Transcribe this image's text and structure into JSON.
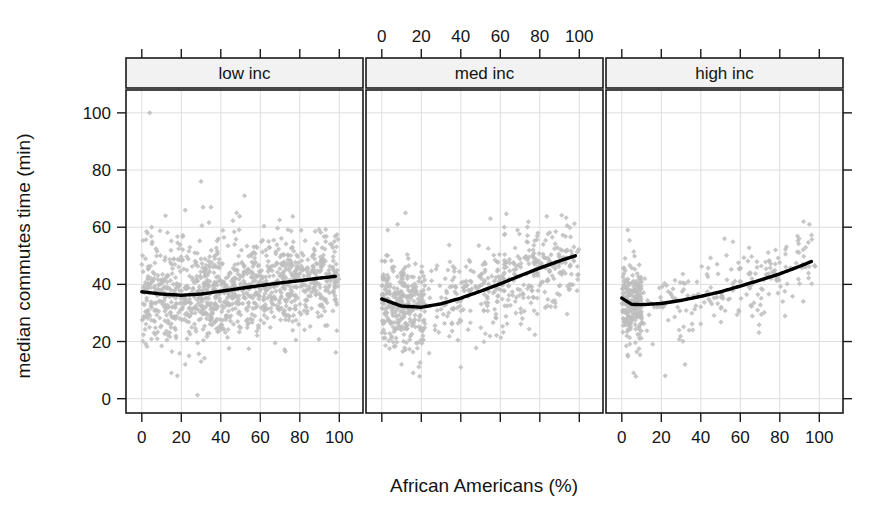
{
  "figure": {
    "kind": "lattice-trellis-scatter",
    "width": 888,
    "height": 513
  },
  "axes": {
    "x_title": "African Americans (%)",
    "y_title": "median commutes time (min)",
    "x_ticks": [
      0,
      20,
      40,
      60,
      80,
      100
    ],
    "y_ticks": [
      0,
      20,
      40,
      60,
      80,
      100
    ],
    "x_tick_labels": [
      "0",
      "20",
      "40",
      "60",
      "80",
      "100"
    ],
    "y_tick_labels": [
      "0",
      "20",
      "40",
      "60",
      "80",
      "100"
    ],
    "xlim": [
      -8,
      112
    ],
    "ylim": [
      -5,
      108
    ],
    "grid": true,
    "top_axis_labeled_panels": [
      2
    ],
    "bottom_axis_labeled_panels": [
      1,
      3
    ]
  },
  "strips": {
    "labels": [
      "low inc",
      "med inc",
      "high inc"
    ],
    "background": "#f2f2f2",
    "border": "#1a1a1a"
  },
  "colors": {
    "point": "#bdbdbd",
    "trend": "#000000",
    "grid": "#dedede",
    "frame": "#1a1a1a",
    "text": "#141414",
    "background": "#ffffff"
  },
  "chart_data": {
    "type": "scatter",
    "title": "",
    "xlabel": "African Americans (%)",
    "ylabel": "median commutes time (min)",
    "xlim": [
      -8,
      112
    ],
    "ylim": [
      -5,
      108
    ],
    "grid": true,
    "legend": "none",
    "panel_variable": "income level",
    "panels": [
      {
        "name": "low inc",
        "n_points": 1100,
        "x_range": [
          0,
          100
        ],
        "y_center": 38,
        "y_spread": 9,
        "trend": {
          "x": [
            0,
            10,
            20,
            30,
            40,
            50,
            60,
            70,
            80,
            90,
            98
          ],
          "y": [
            37.4,
            36.6,
            36.2,
            36.6,
            37.6,
            38.6,
            39.6,
            40.5,
            41.3,
            42.2,
            42.8
          ]
        },
        "outliers": [
          {
            "x": 4,
            "y": 100
          },
          {
            "x": 30,
            "y": 76
          },
          {
            "x": 52,
            "y": 71
          },
          {
            "x": 22,
            "y": 66
          },
          {
            "x": 31,
            "y": 67
          },
          {
            "x": 35,
            "y": 67
          },
          {
            "x": 12,
            "y": 64
          },
          {
            "x": 48,
            "y": 65
          },
          {
            "x": 5,
            "y": 60
          },
          {
            "x": 15,
            "y": 9
          },
          {
            "x": 18,
            "y": 8
          },
          {
            "x": 22,
            "y": 12
          },
          {
            "x": 30,
            "y": 13
          }
        ]
      },
      {
        "name": "med inc",
        "n_points": 700,
        "x_range": [
          0,
          100
        ],
        "y_center": 37,
        "y_spread": 8,
        "trend": {
          "x": [
            0,
            10,
            20,
            30,
            40,
            50,
            60,
            70,
            80,
            90,
            98
          ],
          "y": [
            34.9,
            32.4,
            32.0,
            33.2,
            35.2,
            37.6,
            40.2,
            43.0,
            45.7,
            48.2,
            50.0
          ]
        },
        "outliers": [
          {
            "x": 12,
            "y": 65
          },
          {
            "x": 55,
            "y": 63
          },
          {
            "x": 8,
            "y": 61
          },
          {
            "x": 3,
            "y": 59
          },
          {
            "x": 62,
            "y": 60
          },
          {
            "x": 10,
            "y": 12
          },
          {
            "x": 40,
            "y": 11
          }
        ]
      },
      {
        "name": "high inc",
        "n_points": 420,
        "x_range": [
          0,
          100
        ],
        "y_center": 35,
        "y_spread": 7,
        "trend": {
          "x": [
            0,
            5,
            10,
            20,
            30,
            40,
            50,
            60,
            70,
            80,
            90,
            96
          ],
          "y": [
            35.2,
            33.0,
            32.9,
            33.3,
            34.4,
            35.8,
            37.4,
            39.4,
            41.5,
            43.7,
            46.3,
            48.0
          ]
        },
        "outliers": [
          {
            "x": 3,
            "y": 59
          },
          {
            "x": 92,
            "y": 62
          },
          {
            "x": 95,
            "y": 61
          },
          {
            "x": 52,
            "y": 56
          },
          {
            "x": 6,
            "y": 9
          },
          {
            "x": 22,
            "y": 8
          },
          {
            "x": 32,
            "y": 12
          }
        ]
      }
    ]
  }
}
